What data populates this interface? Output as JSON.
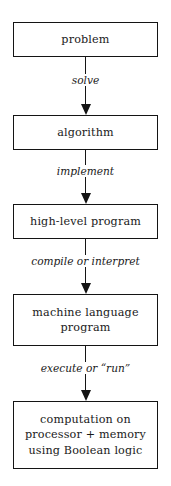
{
  "diagram": {
    "orientation": "vertical-top-down",
    "colors": {
      "background": "#ffffff",
      "stroke": "#141414",
      "text": "#1a1a1a"
    },
    "nodes": [
      {
        "id": "problem",
        "lines": [
          "problem"
        ]
      },
      {
        "id": "algorithm",
        "lines": [
          "algorithm"
        ]
      },
      {
        "id": "high-level-program",
        "lines": [
          "high-level program"
        ]
      },
      {
        "id": "machine-language-program",
        "lines": [
          "machine language",
          "program"
        ]
      },
      {
        "id": "computation",
        "lines": [
          "computation on",
          "processor + memory",
          "using Boolean logic"
        ]
      }
    ],
    "edges": [
      {
        "id": "solve",
        "from": "problem",
        "to": "algorithm",
        "label": "solve"
      },
      {
        "id": "implement",
        "from": "algorithm",
        "to": "high-level-program",
        "label": "implement"
      },
      {
        "id": "compile-or-interpret",
        "from": "high-level-program",
        "to": "machine-language-program",
        "label": "compile or interpret"
      },
      {
        "id": "execute-or-run",
        "from": "machine-language-program",
        "to": "computation",
        "label": "execute or “run”"
      }
    ]
  }
}
